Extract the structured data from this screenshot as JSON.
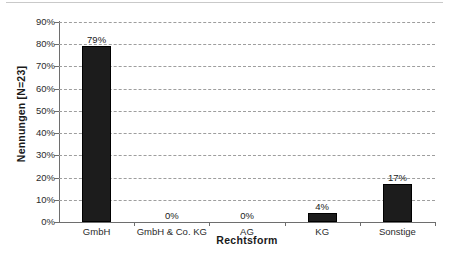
{
  "chart_data": {
    "type": "bar",
    "title": "",
    "xlabel": "Rechtsform",
    "ylabel": "Nennungen [N=23]",
    "categories": [
      "GmbH",
      "GmbH & Co. KG",
      "AG",
      "KG",
      "Sonstige"
    ],
    "values": [
      79,
      0,
      0,
      4,
      17
    ],
    "value_labels": [
      "79%",
      "0%",
      "0%",
      "4%",
      "17%"
    ],
    "ylim": [
      0,
      90
    ],
    "ytick_labels": [
      "90%",
      "80%",
      "70%",
      "60%",
      "50%",
      "40%",
      "30%",
      "20%",
      "10%",
      "0%"
    ],
    "ytick_values": [
      90,
      80,
      70,
      60,
      50,
      40,
      30,
      20,
      10,
      0
    ],
    "grid": true,
    "grid_axis": "y",
    "grid_style": "dashed",
    "legend": false,
    "legend_position": "none",
    "bar_color": "#1c1c1c",
    "grid_color": "#9e9e9e",
    "axis_color": "#6e6e6e",
    "text_color": "#1a1a1a"
  }
}
